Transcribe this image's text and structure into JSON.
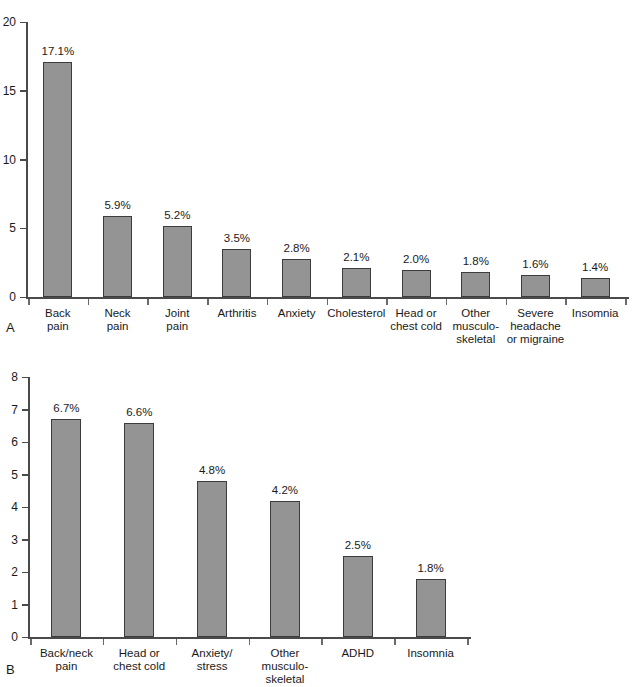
{
  "figure": {
    "panel_a_letter": "A",
    "panel_b_letter": "B",
    "bar_color": "#949494",
    "bar_border_color": "#3c3c3c",
    "axis_color": "#4a4a4a"
  },
  "chart_data": [
    {
      "type": "bar",
      "panel": "A",
      "title": "",
      "xlabel": "",
      "ylabel": "",
      "ylim": [
        0,
        20
      ],
      "yticks": [
        0,
        5,
        10,
        15,
        20
      ],
      "ytick_labels": [
        "0",
        "5",
        "10",
        "15",
        "20"
      ],
      "grid": false,
      "legend": "none",
      "categories": [
        "Back\npain",
        "Neck\npain",
        "Joint\npain",
        "Arthritis",
        "Anxiety",
        "Cholesterol",
        "Head or\nchest cold",
        "Other\nmusculo-\nskeletal",
        "Severe\nheadache\nor migraine",
        "Insomnia"
      ],
      "values": [
        17.1,
        5.9,
        5.2,
        3.5,
        2.8,
        2.1,
        2.0,
        1.8,
        1.6,
        1.4
      ],
      "data_labels": [
        "17.1%",
        "5.9%",
        "5.2%",
        "3.5%",
        "2.8%",
        "2.1%",
        "2.0%",
        "1.8%",
        "1.6%",
        "1.4%"
      ]
    },
    {
      "type": "bar",
      "panel": "B",
      "title": "",
      "xlabel": "",
      "ylabel": "",
      "ylim": [
        0,
        8
      ],
      "yticks": [
        0,
        1,
        2,
        3,
        4,
        5,
        6,
        7,
        8
      ],
      "ytick_labels": [
        "0",
        "1",
        "2",
        "3",
        "4",
        "5",
        "6",
        "7",
        "8"
      ],
      "grid": false,
      "legend": "none",
      "categories": [
        "Back/neck\npain",
        "Head or\nchest cold",
        "Anxiety/\nstress",
        "Other\nmusculo-\nskeletal",
        "ADHD",
        "Insomnia"
      ],
      "values": [
        6.7,
        6.6,
        4.8,
        4.2,
        2.5,
        1.8
      ],
      "data_labels": [
        "6.7%",
        "6.6%",
        "4.8%",
        "4.2%",
        "2.5%",
        "1.8%"
      ]
    }
  ]
}
